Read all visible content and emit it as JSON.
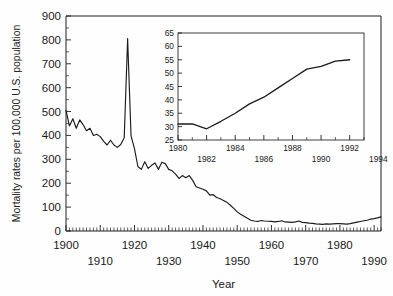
{
  "chart_data": {
    "type": "line",
    "title": "",
    "xlabel": "Year",
    "ylabel": "Mortality rates per 100,000 U.S. population",
    "xlim": [
      1900,
      1992
    ],
    "ylim": [
      0,
      900
    ],
    "grid": false,
    "legend": "none",
    "y_ticks": [
      0,
      100,
      200,
      300,
      400,
      500,
      600,
      700,
      800,
      900
    ],
    "y_tick_labels": [
      "0",
      "100",
      "200",
      "300",
      "400",
      "500",
      "600",
      "700",
      "800",
      "900"
    ],
    "x_ticks": [
      1900,
      1910,
      1920,
      1930,
      1940,
      1950,
      1960,
      1970,
      1980,
      1990
    ],
    "x_tick_labels": [
      "1900",
      "1910",
      "1920",
      "1930",
      "1940",
      "1950",
      "1960",
      "1970",
      "1980",
      "1990"
    ],
    "x_tick_row_top": [
      "1900",
      "1920",
      "1940",
      "1960",
      "1980"
    ],
    "x_tick_row_bottom": [
      "1910",
      "1930",
      "1950",
      "1970",
      "1990"
    ],
    "x": [
      1900,
      1901,
      1902,
      1903,
      1904,
      1905,
      1906,
      1907,
      1908,
      1909,
      1910,
      1911,
      1912,
      1913,
      1914,
      1915,
      1916,
      1917,
      1918,
      1919,
      1920,
      1921,
      1922,
      1923,
      1924,
      1925,
      1926,
      1927,
      1928,
      1929,
      1930,
      1931,
      1932,
      1933,
      1934,
      1935,
      1936,
      1937,
      1938,
      1939,
      1940,
      1941,
      1942,
      1943,
      1944,
      1945,
      1946,
      1947,
      1948,
      1949,
      1950,
      1951,
      1952,
      1953,
      1954,
      1955,
      1956,
      1957,
      1958,
      1959,
      1960,
      1961,
      1962,
      1963,
      1964,
      1965,
      1966,
      1967,
      1968,
      1969,
      1970,
      1971,
      1972,
      1973,
      1974,
      1975,
      1976,
      1977,
      1978,
      1979,
      1980,
      1981,
      1982,
      1983,
      1984,
      1985,
      1986,
      1987,
      1988,
      1989,
      1990,
      1991,
      1992
    ],
    "values": [
      505,
      440,
      470,
      430,
      465,
      445,
      420,
      430,
      400,
      405,
      395,
      375,
      360,
      380,
      360,
      350,
      362,
      390,
      805,
      398,
      345,
      270,
      258,
      290,
      262,
      275,
      285,
      258,
      288,
      282,
      258,
      252,
      238,
      220,
      232,
      223,
      232,
      212,
      185,
      180,
      175,
      168,
      150,
      152,
      140,
      135,
      128,
      120,
      108,
      95,
      80,
      70,
      62,
      53,
      45,
      42,
      40,
      44,
      42,
      41,
      40,
      38,
      40,
      43,
      38,
      37,
      36,
      38,
      42,
      36,
      35,
      33,
      32,
      30,
      29,
      28,
      30,
      29,
      30,
      31,
      31,
      30,
      29,
      31,
      34,
      37,
      40,
      43,
      45,
      50,
      52,
      55,
      59
    ],
    "annotations": []
  },
  "inset_chart_data": {
    "type": "line",
    "title": "",
    "xlabel": "",
    "ylabel": "",
    "xlim": [
      1980,
      1993
    ],
    "ylim": [
      25,
      65
    ],
    "grid": false,
    "legend": "none",
    "y_ticks": [
      25,
      30,
      35,
      40,
      45,
      50,
      55,
      60,
      65
    ],
    "y_tick_labels": [
      "25",
      "30",
      "35",
      "40",
      "45",
      "50",
      "55",
      "60",
      "65"
    ],
    "x_ticks": [
      1980,
      1981,
      1982,
      1983,
      1984,
      1985,
      1986,
      1987,
      1988,
      1989,
      1990,
      1991,
      1992,
      1993
    ],
    "x_tick_labels": [
      "1980",
      "1982",
      "1984",
      "1986",
      "1988",
      "1990",
      "1992",
      "1994"
    ],
    "x_tick_row_top": [
      "1980",
      "1984",
      "1988",
      "1992"
    ],
    "x_tick_row_bottom": [
      "1982",
      "1986",
      "1990",
      "1994"
    ],
    "x": [
      1980,
      1981,
      1982,
      1983,
      1984,
      1985,
      1986,
      1987,
      1988,
      1989,
      1990,
      1991,
      1992
    ],
    "values": [
      31.0,
      31.0,
      29.2,
      32.0,
      35.0,
      38.5,
      41.0,
      44.5,
      48.0,
      51.5,
      52.5,
      54.5,
      55.0
    ]
  },
  "colors": {
    "line": "#1c1c1c",
    "axis": "#1f1f1f",
    "background": "#fefefe",
    "inset_line": "#1c1c1c"
  }
}
